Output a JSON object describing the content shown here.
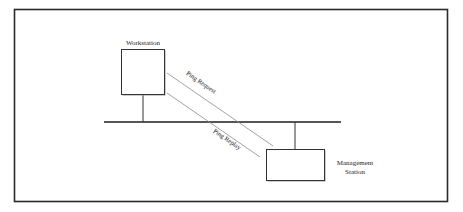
{
  "diagram": {
    "type": "network-topology",
    "nodes": [
      {
        "id": "workstation",
        "label": "Workstation"
      },
      {
        "id": "management",
        "label_lines": [
          "Management",
          "Station"
        ]
      }
    ],
    "bus": {
      "id": "network-bus",
      "label": ""
    },
    "messages": [
      {
        "id": "ping-request",
        "label": "Ping Request",
        "from": "workstation",
        "to": "management"
      },
      {
        "id": "ping-replay",
        "label": "Ping Replay",
        "from": "management",
        "to": "workstation"
      }
    ],
    "colors": {
      "frame": "#2a2a2a",
      "lines": "#333333",
      "message_lines": "#8a8a8a",
      "background": "#ffffff"
    }
  }
}
